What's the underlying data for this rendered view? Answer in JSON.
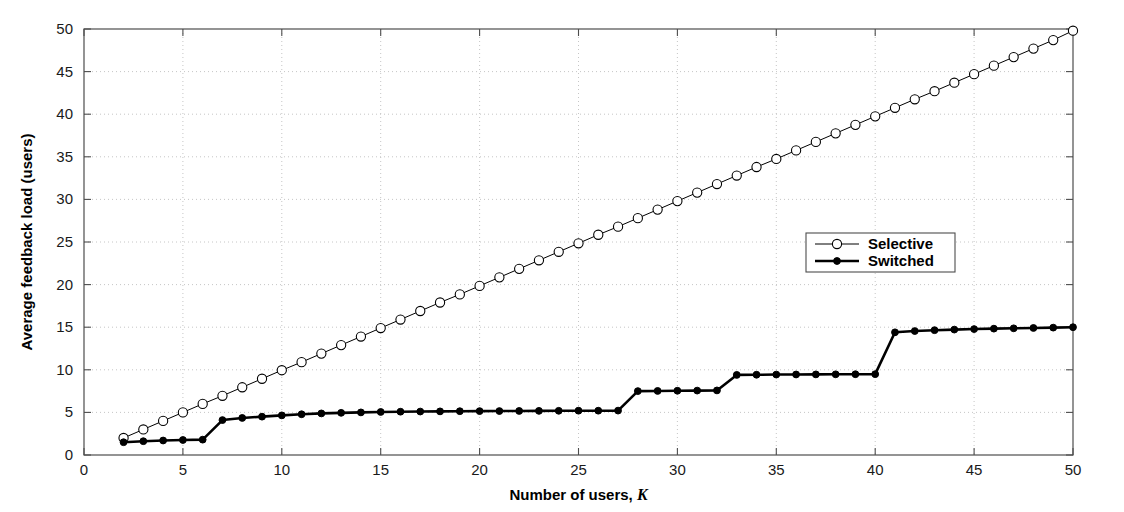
{
  "chart_data": {
    "type": "line",
    "title": "",
    "xlabel": "Number of users, K",
    "xlabel_main": "Number of users,",
    "xlabel_italic": "K",
    "ylabel": "Average feedback load (users)",
    "xlim": [
      0,
      50
    ],
    "ylim": [
      0,
      50
    ],
    "xticks": [
      0,
      5,
      10,
      15,
      20,
      25,
      30,
      35,
      40,
      45,
      50
    ],
    "yticks": [
      0,
      5,
      10,
      15,
      20,
      25,
      30,
      35,
      40,
      45,
      50
    ],
    "xticklabels": [
      "0",
      "5",
      "10",
      "15",
      "20",
      "25",
      "30",
      "35",
      "40",
      "45",
      "50"
    ],
    "yticklabels": [
      "0",
      "5",
      "10",
      "15",
      "20",
      "25",
      "30",
      "35",
      "40",
      "45",
      "50"
    ],
    "grid": "dotted",
    "grid_color": "#bfbfbf",
    "legend_position": "center-right",
    "x": [
      2,
      3,
      4,
      5,
      6,
      7,
      8,
      9,
      10,
      11,
      12,
      13,
      14,
      15,
      16,
      17,
      18,
      19,
      20,
      21,
      22,
      23,
      24,
      25,
      26,
      27,
      28,
      29,
      30,
      31,
      32,
      33,
      34,
      35,
      36,
      37,
      38,
      39,
      40,
      41,
      42,
      43,
      44,
      45,
      46,
      47,
      48,
      49,
      50
    ],
    "series": [
      {
        "name": "Selective",
        "marker": "open-circle",
        "line_width": 1,
        "color": "#000000",
        "values": [
          2.0,
          3.0,
          4.0,
          5.0,
          6.0,
          6.95,
          7.95,
          8.95,
          9.95,
          10.9,
          11.9,
          12.9,
          13.9,
          14.9,
          15.9,
          16.9,
          17.9,
          18.85,
          19.85,
          20.85,
          21.85,
          22.85,
          23.85,
          24.85,
          25.85,
          26.8,
          27.8,
          28.8,
          29.8,
          30.8,
          31.8,
          32.8,
          33.8,
          34.75,
          35.75,
          36.75,
          37.75,
          38.75,
          39.75,
          40.75,
          41.75,
          42.7,
          43.7,
          44.7,
          45.7,
          46.7,
          47.7,
          48.7,
          49.8
        ]
      },
      {
        "name": "Switched",
        "marker": "filled-circle",
        "line_width": 2.6,
        "color": "#000000",
        "values": [
          1.5,
          1.62,
          1.7,
          1.76,
          1.8,
          4.1,
          4.35,
          4.5,
          4.65,
          4.78,
          4.88,
          4.95,
          5.0,
          5.05,
          5.08,
          5.1,
          5.12,
          5.14,
          5.15,
          5.16,
          5.17,
          5.18,
          5.19,
          5.2,
          5.2,
          5.21,
          7.5,
          7.52,
          7.54,
          7.56,
          7.58,
          9.4,
          9.42,
          9.44,
          9.45,
          9.46,
          9.47,
          9.48,
          9.49,
          14.4,
          14.55,
          14.65,
          14.72,
          14.78,
          14.83,
          14.87,
          14.91,
          14.95,
          15.0
        ]
      }
    ],
    "annotations": []
  },
  "legend": {
    "entries": [
      {
        "label": "Selective"
      },
      {
        "label": "Switched"
      }
    ]
  }
}
